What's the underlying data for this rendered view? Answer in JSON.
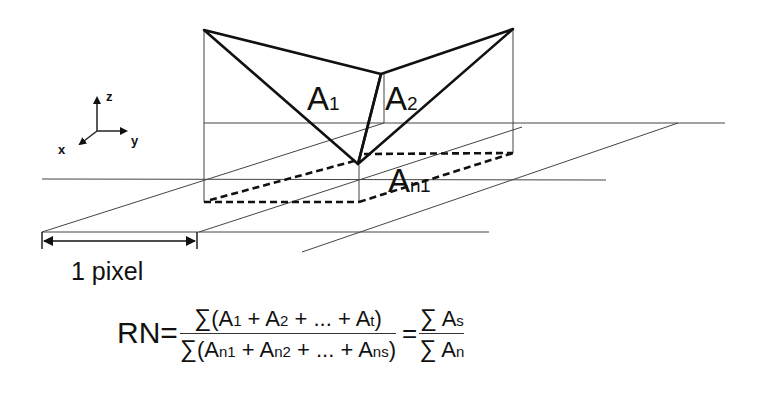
{
  "figure": {
    "axes": {
      "z_label": "z",
      "y_label": "y",
      "x_label": "x"
    },
    "labels": {
      "a1_main": "A",
      "a1_sub": "1",
      "a2_main": "A",
      "a2_sub": "2",
      "an1_main": "A",
      "an1_sub": "n1"
    },
    "scale": {
      "label": "1 pixel"
    },
    "formula": {
      "lhs": "RN=",
      "numerator": {
        "sigma": "∑",
        "open": "(A",
        "t1": "1",
        "plus1": " + A",
        "t2": "2",
        "plus2": " + ... + A",
        "t3": "t",
        "close": ")"
      },
      "denominator": {
        "sigma": "∑",
        "open": "(A",
        "t1": "n1",
        "plus1": " + A",
        "t2": "n2",
        "plus2": " + ... + A",
        "t3": "ns",
        "close": ")"
      },
      "equals": "=",
      "rhs_numerator": {
        "sigma": "∑",
        "a": " A",
        "sub": "s"
      },
      "rhs_denominator": {
        "sigma": "∑",
        "a": " A",
        "sub": "n"
      }
    },
    "colors": {
      "stroke": "#111111",
      "grid": "#444444",
      "background": "#ffffff"
    }
  }
}
